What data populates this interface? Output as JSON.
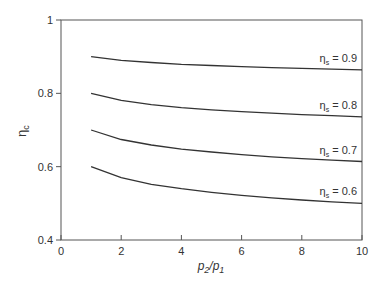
{
  "chart_data": {
    "type": "line",
    "title": "",
    "xlabel": "p2/p1",
    "ylabel": "ηc",
    "xlim": [
      0,
      10
    ],
    "ylim": [
      0.4,
      1.0
    ],
    "x_ticks": [
      "0",
      "2",
      "4",
      "6",
      "8",
      "10"
    ],
    "y_ticks": [
      "0.4",
      "0.6",
      "0.8",
      "1"
    ],
    "grid": false,
    "legend": "inline labels at right end of each curve",
    "x": [
      1,
      2,
      3,
      4,
      5,
      6,
      7,
      8,
      9,
      10
    ],
    "series": [
      {
        "name": "ηs = 0.9",
        "values": [
          0.9,
          0.89,
          0.884,
          0.879,
          0.876,
          0.873,
          0.87,
          0.868,
          0.866,
          0.864
        ]
      },
      {
        "name": "ηs = 0.8",
        "values": [
          0.8,
          0.781,
          0.769,
          0.761,
          0.755,
          0.75,
          0.746,
          0.742,
          0.739,
          0.736
        ]
      },
      {
        "name": "ηs = 0.7",
        "values": [
          0.7,
          0.674,
          0.659,
          0.648,
          0.64,
          0.633,
          0.627,
          0.622,
          0.618,
          0.614
        ]
      },
      {
        "name": "ηs = 0.6",
        "values": [
          0.6,
          0.57,
          0.552,
          0.54,
          0.53,
          0.522,
          0.515,
          0.509,
          0.504,
          0.5
        ]
      }
    ]
  }
}
